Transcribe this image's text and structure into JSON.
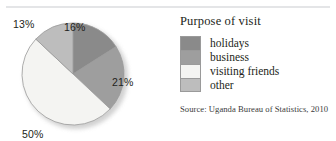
{
  "chart_data": {
    "type": "pie",
    "title": "Purpose of visit",
    "source": "Source: Uganda Bureau of Statistics, 2010",
    "categories": [
      "holidays",
      "business",
      "visiting friends",
      "other"
    ],
    "values": [
      16,
      21,
      50,
      13
    ],
    "value_labels": [
      "16%",
      "21%",
      "50%",
      "13%"
    ],
    "unit": "%",
    "colors": [
      "#8a8a8a",
      "#9e9e9e",
      "#f4f4f2",
      "#bdbdbd"
    ],
    "legend_position": "right",
    "grid": false,
    "start_angle_deg": 0,
    "direction": "clockwise",
    "slices": [
      {
        "label": "holidays",
        "value": 16,
        "value_label": "16%",
        "color": "#8a8a8a",
        "start_deg": 0,
        "end_deg": 57.6
      },
      {
        "label": "business",
        "value": 21,
        "value_label": "21%",
        "color": "#9e9e9e",
        "start_deg": 57.6,
        "end_deg": 133.2
      },
      {
        "label": "visiting friends",
        "value": 50,
        "value_label": "50%",
        "color": "#f4f4f2",
        "start_deg": 133.2,
        "end_deg": 313.2
      },
      {
        "label": "other",
        "value": 13,
        "value_label": "13%",
        "color": "#bdbdbd",
        "start_deg": 313.2,
        "end_deg": 360
      }
    ]
  },
  "legend": {
    "title": "Purpose of visit",
    "items": [
      {
        "label": "holidays",
        "color": "#8a8a8a"
      },
      {
        "label": "business",
        "color": "#9e9e9e"
      },
      {
        "label": "visiting friends",
        "color": "#f4f4f2"
      },
      {
        "label": "other",
        "color": "#bdbdbd"
      }
    ]
  },
  "source_note": "Source: Uganda Bureau of Statistics, 2010",
  "labels": {
    "pct_13": "13%",
    "pct_16": "16%",
    "pct_21": "21%",
    "pct_50": "50%"
  },
  "colors": {
    "slice_holidays": "#8a8a8a",
    "slice_business": "#9e9e9e",
    "slice_visiting_friends": "#f4f4f2",
    "slice_other": "#bdbdbd",
    "outline": "#9a9a9a",
    "text": "#231f20",
    "top_rule": "#e4e5e7"
  }
}
